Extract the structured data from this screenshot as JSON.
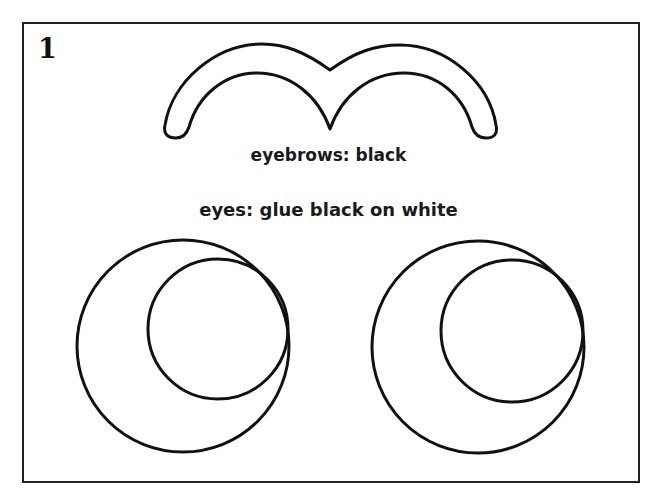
{
  "panel": {
    "number": "1"
  },
  "labels": {
    "eyebrows": "eyebrows: black",
    "eyes": "eyes: glue black on white"
  },
  "shapes": {
    "eyebrows": {
      "type": "double-arch outline",
      "color": "#111111"
    },
    "left_eye": {
      "outer_circle": {
        "cx": 183,
        "cy": 346,
        "r": 106
      },
      "pupil_circle": {
        "cx": 218,
        "cy": 329,
        "r": 70
      }
    },
    "right_eye": {
      "outer_circle": {
        "cx": 478,
        "cy": 347,
        "r": 106
      },
      "pupil_circle": {
        "cx": 512,
        "cy": 331,
        "r": 71
      }
    },
    "stroke_color": "#111111",
    "fill_color": "#ffffff"
  }
}
